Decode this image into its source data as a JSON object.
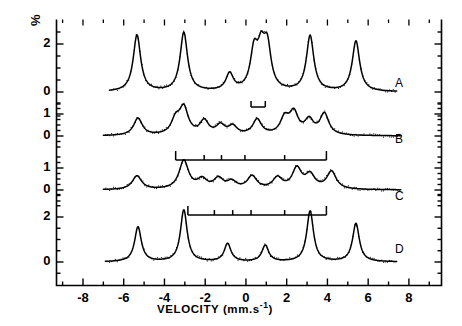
{
  "figure": {
    "type": "mossbauer-spectra-figure",
    "background_color": "#ffffff",
    "line_color": "#000000"
  },
  "axes": {
    "y_axis_label": "%",
    "x_axis_label_text": "VELOCITY  (mm.s",
    "x_axis_label_exponent": "-1",
    "x_axis_label_close": ")",
    "x_axis_label_full": "VELOCITY (mm.s-1)",
    "x_ticks_major": [
      -8,
      -6,
      -4,
      -2,
      0,
      2,
      4,
      6,
      8
    ],
    "x_tick_labels": [
      "-8",
      "-6",
      "-4",
      "-2",
      "0",
      "2",
      "4",
      "6",
      "8"
    ],
    "x_minor_step": 1,
    "x_range": [
      -9.3,
      9.6
    ],
    "y_tick_labels_by_panel": {
      "A": [
        "2",
        "0"
      ],
      "B": [
        "1",
        "0"
      ],
      "C": [
        "1",
        "0"
      ],
      "D": [
        "2",
        "0"
      ]
    },
    "panel_labels": [
      "A",
      "B",
      "C",
      "D"
    ]
  },
  "chart_data": {
    "type": "line",
    "title": "",
    "xlabel": "VELOCITY (mm.s-1)",
    "ylabel": "%",
    "xlim": [
      -9.3,
      9.6
    ],
    "grid": false,
    "legend": "none",
    "panels": [
      {
        "name": "A",
        "label": "A",
        "yticks": [
          0,
          2
        ],
        "ytick_labels": [
          "0",
          "2"
        ],
        "baseline_value": 0,
        "peaks": [
          {
            "x": -5.35,
            "height": 2.35
          },
          {
            "x": -3.05,
            "height": 2.45
          },
          {
            "x": -0.8,
            "height": 0.7
          },
          {
            "x": 0.4,
            "height": 1.55
          },
          {
            "x": 0.75,
            "height": 1.45
          },
          {
            "x": 1.05,
            "height": 1.7
          },
          {
            "x": 3.15,
            "height": 2.3
          },
          {
            "x": 5.4,
            "height": 2.1
          }
        ],
        "marker_comb": {
          "x_start": 0.25,
          "x_end": 0.95,
          "ticks": [
            0.25,
            0.95
          ]
        }
      },
      {
        "name": "B",
        "label": "B",
        "yticks": [
          0,
          1
        ],
        "ytick_labels": [
          "0",
          "1"
        ],
        "baseline_value": 0,
        "peaks": [
          {
            "x": -5.3,
            "height": 0.78
          },
          {
            "x": -3.45,
            "height": 0.66
          },
          {
            "x": -3.05,
            "height": 1.18
          },
          {
            "x": -2.05,
            "height": 0.62
          },
          {
            "x": -1.25,
            "height": 0.42
          },
          {
            "x": -0.65,
            "height": 0.38
          },
          {
            "x": 0.55,
            "height": 0.7
          },
          {
            "x": 1.9,
            "height": 0.72
          },
          {
            "x": 2.35,
            "height": 0.96
          },
          {
            "x": 3.1,
            "height": 0.64
          },
          {
            "x": 3.85,
            "height": 0.96
          }
        ],
        "marker_comb": {
          "x_start": -3.45,
          "x_end": 3.95,
          "ticks": [
            -3.45,
            -2.05,
            -1.2,
            -0.05,
            1.9,
            3.95
          ]
        }
      },
      {
        "name": "C",
        "label": "C",
        "yticks": [
          0,
          1
        ],
        "ytick_labels": [
          "0",
          "1"
        ],
        "baseline_value": 0,
        "peaks": [
          {
            "x": -5.35,
            "height": 0.62
          },
          {
            "x": -3.05,
            "height": 1.3
          },
          {
            "x": -2.15,
            "height": 0.42
          },
          {
            "x": -1.35,
            "height": 0.46
          },
          {
            "x": -0.7,
            "height": 0.32
          },
          {
            "x": 0.3,
            "height": 0.58
          },
          {
            "x": 1.55,
            "height": 0.5
          },
          {
            "x": 2.5,
            "height": 0.92
          },
          {
            "x": 3.15,
            "height": 0.62
          },
          {
            "x": 4.2,
            "height": 0.8
          }
        ],
        "marker_comb": {
          "x_start": -2.85,
          "x_end": 3.95,
          "ticks": [
            -2.85,
            -1.55,
            -0.65,
            0.25,
            1.9,
            3.95
          ]
        }
      },
      {
        "name": "D",
        "label": "D",
        "yticks": [
          0,
          2
        ],
        "ytick_labels": [
          "0",
          "2"
        ],
        "baseline_value": 0,
        "peaks": [
          {
            "x": -5.3,
            "height": 1.55
          },
          {
            "x": -3.05,
            "height": 2.3
          },
          {
            "x": -0.9,
            "height": 0.8
          },
          {
            "x": 0.95,
            "height": 0.72
          },
          {
            "x": 3.15,
            "height": 2.25
          },
          {
            "x": 5.4,
            "height": 1.7
          }
        ],
        "marker_comb": null
      }
    ]
  }
}
